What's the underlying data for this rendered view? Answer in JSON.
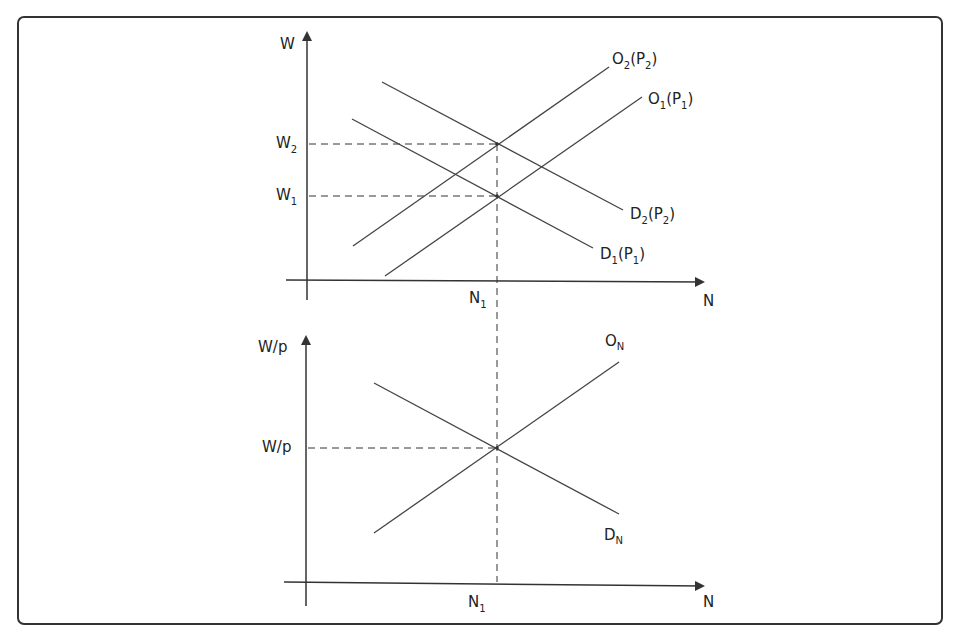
{
  "diagram": {
    "type": "labor market diagram",
    "colors": {
      "line": "#333333",
      "frame": "#333333",
      "background": "#ffffff"
    },
    "top_panel": {
      "y_axis_label": "W",
      "x_axis_label": "N",
      "y_ticks": [
        {
          "base": "W",
          "sub": "2"
        },
        {
          "base": "W",
          "sub": "1"
        }
      ],
      "x_tick": {
        "base": "N",
        "sub": "1"
      },
      "curves": [
        {
          "id": "O2",
          "base": "O",
          "sub": "2",
          "arg_base": "P",
          "arg_sub": "2",
          "kind": "supply"
        },
        {
          "id": "O1",
          "base": "O",
          "sub": "1",
          "arg_base": "P",
          "arg_sub": "1",
          "kind": "supply"
        },
        {
          "id": "D2",
          "base": "D",
          "sub": "2",
          "arg_base": "P",
          "arg_sub": "2",
          "kind": "demand"
        },
        {
          "id": "D1",
          "base": "D",
          "sub": "1",
          "arg_base": "P",
          "arg_sub": "1",
          "kind": "demand"
        }
      ]
    },
    "bottom_panel": {
      "y_axis_label": "W/p",
      "x_axis_label": "N",
      "y_tick": "W/p",
      "x_tick": {
        "base": "N",
        "sub": "1"
      },
      "curves": [
        {
          "id": "ON",
          "base": "O",
          "sub": "N",
          "kind": "supply"
        },
        {
          "id": "DN",
          "base": "D",
          "sub": "N",
          "kind": "demand"
        }
      ]
    }
  }
}
